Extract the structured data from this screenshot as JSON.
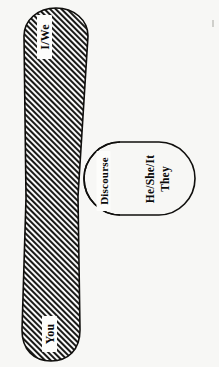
{
  "figure": {
    "kind": "venn-diagram",
    "orientation_note": "all labels rotated 90 degrees (sideways scan)",
    "background_color": "#f7f7f5",
    "stroke_color": "#100f0d",
    "hatch_color": "#1a1a18"
  },
  "regions": {
    "speaker_band": {
      "name": "speaker-addressee-band",
      "fill": "hatched",
      "top_label": "I/We",
      "bottom_label": "You"
    },
    "third_person": {
      "name": "third-person-set",
      "fill": "white",
      "label_line_1": "He/She/It",
      "label_line_2": "They"
    },
    "overlap": {
      "name": "discourse-overlap",
      "fill": "hatched",
      "label": "Discourse"
    }
  },
  "labels": {
    "i_we": "I/We",
    "you": "You",
    "he_she_it": "He/She/It",
    "they": "They",
    "discourse": "Discourse"
  }
}
